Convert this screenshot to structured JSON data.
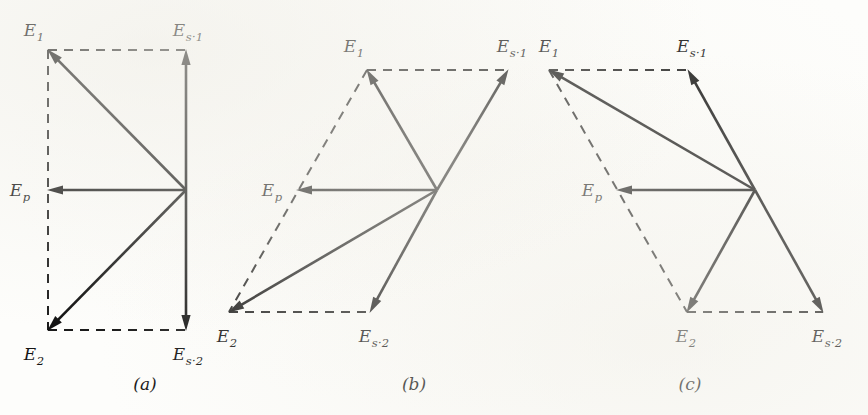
{
  "figure": {
    "background_color": "#fdfdfb",
    "line_color": "#111111",
    "width": 868,
    "height": 415
  },
  "labels": {
    "E1": {
      "base": "E",
      "sub": "1",
      "text": "E₁"
    },
    "E2": {
      "base": "E",
      "sub": "2",
      "text": "E₂"
    },
    "Ep": {
      "base": "E",
      "sub": "p",
      "text": "Eₚ"
    },
    "Es1": {
      "base": "E",
      "sub": "s·1",
      "text": "Eₛ·₁"
    },
    "Es2": {
      "base": "E",
      "sub": "s·2",
      "text": "Eₛ·₂"
    }
  },
  "panels": [
    {
      "id": "a",
      "caption": "(a)",
      "caption_pos": {
        "x": 145,
        "y": 390
      },
      "origin": {
        "x": 186,
        "y": 190
      },
      "points": {
        "E1": {
          "x": 48,
          "y": 50
        },
        "E2": {
          "x": 48,
          "y": 330
        },
        "Ep": {
          "x": 48,
          "y": 190
        },
        "Es1": {
          "x": 186,
          "y": 50
        },
        "Es2": {
          "x": 186,
          "y": 330
        }
      },
      "label_pos": {
        "E1": {
          "x": 34,
          "y": 36,
          "anchor": "middle"
        },
        "E2": {
          "x": 34,
          "y": 360,
          "anchor": "middle"
        },
        "Ep": {
          "x": 20,
          "y": 196,
          "anchor": "middle"
        },
        "Es1": {
          "x": 188,
          "y": 36,
          "anchor": "middle"
        },
        "Es2": {
          "x": 188,
          "y": 360,
          "anchor": "middle"
        }
      },
      "solid_vectors": [
        {
          "name": "vector-origin-to-E1",
          "from": "origin",
          "to": "E1"
        },
        {
          "name": "vector-origin-to-E2",
          "from": "origin",
          "to": "E2"
        },
        {
          "name": "vector-origin-to-Ep",
          "from": "origin",
          "to": "Ep"
        },
        {
          "name": "vector-origin-to-Es1",
          "from": "origin",
          "to": "Es1"
        },
        {
          "name": "vector-origin-to-Es2",
          "from": "origin",
          "to": "Es2"
        }
      ],
      "dashed_lines": [
        {
          "name": "construction-E1-Es1",
          "from": "E1",
          "to": "Es1"
        },
        {
          "name": "construction-E2-Es2",
          "from": "E2",
          "to": "Es2"
        },
        {
          "name": "construction-E1-E2",
          "from": "E1",
          "to": "E2"
        }
      ]
    },
    {
      "id": "b",
      "caption": "(b)",
      "caption_pos": {
        "x": 414,
        "y": 390
      },
      "origin": {
        "x": 437,
        "y": 190
      },
      "points": {
        "E1": {
          "x": 367,
          "y": 70
        },
        "E2": {
          "x": 229,
          "y": 312
        },
        "Ep": {
          "x": 297,
          "y": 190
        },
        "Es1": {
          "x": 508,
          "y": 70
        },
        "Es2": {
          "x": 370,
          "y": 312
        }
      },
      "label_pos": {
        "E1": {
          "x": 354,
          "y": 52,
          "anchor": "middle"
        },
        "E2": {
          "x": 227,
          "y": 342,
          "anchor": "middle"
        },
        "Ep": {
          "x": 272,
          "y": 196,
          "anchor": "middle"
        },
        "Es1": {
          "x": 512,
          "y": 52,
          "anchor": "middle"
        },
        "Es2": {
          "x": 374,
          "y": 342,
          "anchor": "middle"
        }
      },
      "solid_vectors": [
        {
          "name": "vector-origin-to-E1",
          "from": "origin",
          "to": "E1"
        },
        {
          "name": "vector-origin-to-E2",
          "from": "origin",
          "to": "E2"
        },
        {
          "name": "vector-origin-to-Ep",
          "from": "origin",
          "to": "Ep"
        },
        {
          "name": "vector-origin-to-Es1",
          "from": "origin",
          "to": "Es1"
        },
        {
          "name": "vector-origin-to-Es2",
          "from": "origin",
          "to": "Es2"
        }
      ],
      "dashed_lines": [
        {
          "name": "construction-E1-Es1",
          "from": "E1",
          "to": "Es1"
        },
        {
          "name": "construction-E2-Es2",
          "from": "E2",
          "to": "Es2"
        },
        {
          "name": "construction-E1-E2",
          "from": "E1",
          "to": "E2"
        }
      ]
    },
    {
      "id": "c",
      "caption": "(c)",
      "caption_pos": {
        "x": 690,
        "y": 390
      },
      "origin": {
        "x": 755,
        "y": 190
      },
      "points": {
        "E1": {
          "x": 549,
          "y": 70
        },
        "E2": {
          "x": 687,
          "y": 312
        },
        "Ep": {
          "x": 617,
          "y": 190
        },
        "Es1": {
          "x": 688,
          "y": 70
        },
        "Es2": {
          "x": 823,
          "y": 312
        }
      },
      "label_pos": {
        "E1": {
          "x": 549,
          "y": 52,
          "anchor": "middle"
        },
        "E2": {
          "x": 686,
          "y": 342,
          "anchor": "middle"
        },
        "Ep": {
          "x": 592,
          "y": 196,
          "anchor": "middle"
        },
        "Es1": {
          "x": 692,
          "y": 52,
          "anchor": "middle"
        },
        "Es2": {
          "x": 827,
          "y": 342,
          "anchor": "middle"
        }
      },
      "solid_vectors": [
        {
          "name": "vector-origin-to-E1",
          "from": "origin",
          "to": "E1"
        },
        {
          "name": "vector-origin-to-E2",
          "from": "origin",
          "to": "E2"
        },
        {
          "name": "vector-origin-to-Ep",
          "from": "origin",
          "to": "Ep"
        },
        {
          "name": "vector-origin-to-Es1",
          "from": "origin",
          "to": "Es1"
        },
        {
          "name": "vector-origin-to-Es2",
          "from": "origin",
          "to": "Es2"
        }
      ],
      "dashed_lines": [
        {
          "name": "construction-E1-Es1",
          "from": "E1",
          "to": "Es1"
        },
        {
          "name": "construction-E2-Es2",
          "from": "E2",
          "to": "Es2"
        },
        {
          "name": "construction-E1-E2",
          "from": "E1",
          "to": "E2"
        }
      ]
    }
  ]
}
